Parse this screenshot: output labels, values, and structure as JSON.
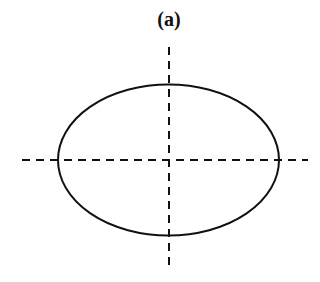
{
  "figure": {
    "label": "(a)",
    "shape": "ellipse",
    "ellipse": {
      "cx": 168.5,
      "cy": 160,
      "rx": 110.5,
      "ry": 75.5
    },
    "axes": {
      "horizontal": {
        "x1": 22,
        "x2": 308,
        "y": 160,
        "style": "dashed"
      },
      "vertical": {
        "x": 169,
        "y1": 47,
        "y2": 270,
        "style": "dashed"
      }
    },
    "stroke_color": "#111111"
  }
}
